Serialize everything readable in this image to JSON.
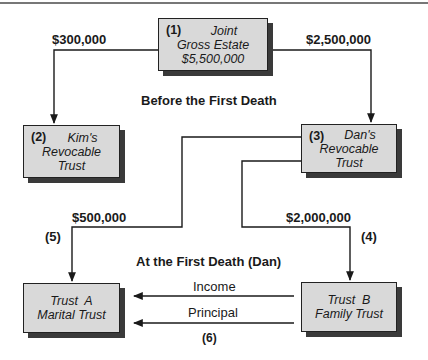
{
  "diagram": {
    "colors": {
      "box_fill": "#d9d9d9",
      "box_border": "#222222",
      "shadow": "#3a3a3a",
      "line": "#1a1a1a"
    },
    "nodes": {
      "joint": {
        "num": "(1)",
        "line1": "Joint",
        "line2": "Gross Estate",
        "line3": "$5,500,000"
      },
      "kim": {
        "num": "(2)",
        "line1": "Kim's",
        "line2": "Revocable",
        "line3": "Trust"
      },
      "dan": {
        "num": "(3)",
        "line1": "Dan's",
        "line2": "Revocable",
        "line3": "Trust"
      },
      "trust_a": {
        "line1": "Trust  A",
        "line2": "Marital Trust"
      },
      "trust_b": {
        "line1": "Trust  B",
        "line2": "Family Trust"
      }
    },
    "edges": {
      "joint_to_kim": {
        "amount": "$300,000"
      },
      "joint_to_dan": {
        "amount": "$2,500,000"
      },
      "dan_to_a": {
        "amount": "$500,000",
        "step": "(5)"
      },
      "dan_to_b": {
        "amount": "$2,000,000",
        "step": "(4)"
      },
      "b_to_a_income": {
        "label": "Income"
      },
      "b_to_a_principal": {
        "label": "Principal",
        "step": "(6)"
      }
    },
    "section_labels": {
      "before": "Before the First Death",
      "at": "At the First Death (Dan)"
    }
  }
}
